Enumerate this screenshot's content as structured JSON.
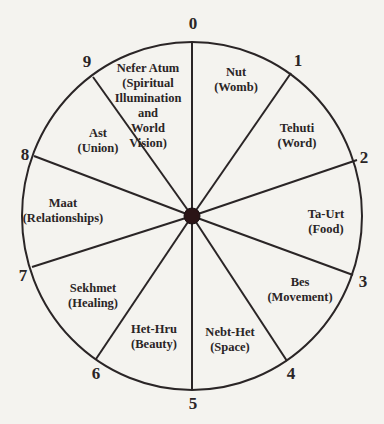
{
  "diagram": {
    "type": "wheel",
    "center": {
      "x": 192,
      "y": 216
    },
    "radius_x": 170,
    "radius_y": 174,
    "hub_radius": 8,
    "colors": {
      "background": "#f4f3ef",
      "ink": "#2a2526"
    },
    "spokes": [
      {
        "number": "0",
        "end": {
          "x": 192,
          "y": 42
        },
        "label_pos": {
          "x": 193,
          "y": 23
        }
      },
      {
        "number": "1",
        "end": {
          "x": 291,
          "y": 73
        },
        "label_pos": {
          "x": 298,
          "y": 60
        }
      },
      {
        "number": "2",
        "end": {
          "x": 357,
          "y": 160
        },
        "label_pos": {
          "x": 364,
          "y": 157
        }
      },
      {
        "number": "3",
        "end": {
          "x": 353,
          "y": 275
        },
        "label_pos": {
          "x": 363,
          "y": 281
        }
      },
      {
        "number": "4",
        "end": {
          "x": 287,
          "y": 361
        },
        "label_pos": {
          "x": 291,
          "y": 373
        }
      },
      {
        "number": "5",
        "end": {
          "x": 192,
          "y": 390
        },
        "label_pos": {
          "x": 193,
          "y": 403
        }
      },
      {
        "number": "6",
        "end": {
          "x": 96,
          "y": 359
        },
        "label_pos": {
          "x": 96,
          "y": 373
        }
      },
      {
        "number": "7",
        "end": {
          "x": 32,
          "y": 267
        },
        "label_pos": {
          "x": 23,
          "y": 275
        }
      },
      {
        "number": "8",
        "end": {
          "x": 34,
          "y": 156
        },
        "label_pos": {
          "x": 25,
          "y": 154
        }
      },
      {
        "number": "9",
        "end": {
          "x": 93,
          "y": 77
        },
        "label_pos": {
          "x": 87,
          "y": 61
        }
      }
    ],
    "sectors": [
      {
        "name": "Nut",
        "lines": [
          "Nut",
          "(Womb)"
        ],
        "pos": {
          "x": 236,
          "y": 80
        }
      },
      {
        "name": "Tehuti",
        "lines": [
          "Tehuti",
          "(Word)"
        ],
        "pos": {
          "x": 297,
          "y": 136
        }
      },
      {
        "name": "Ta-Urt",
        "lines": [
          "Ta-Urt",
          "(Food)"
        ],
        "pos": {
          "x": 326,
          "y": 222
        }
      },
      {
        "name": "Bes",
        "lines": [
          "Bes",
          "(Movement)"
        ],
        "pos": {
          "x": 300,
          "y": 290
        }
      },
      {
        "name": "Nebt-Het",
        "lines": [
          "Nebt-Het",
          "(Space)"
        ],
        "pos": {
          "x": 230,
          "y": 340
        }
      },
      {
        "name": "Het-Hru",
        "lines": [
          "Het-Hru",
          "(Beauty)"
        ],
        "pos": {
          "x": 154,
          "y": 337
        }
      },
      {
        "name": "Sekhmet",
        "lines": [
          "Sekhmet",
          "(Healing)"
        ],
        "pos": {
          "x": 93,
          "y": 296
        }
      },
      {
        "name": "Maat",
        "lines": [
          "Maat",
          "(Relationships)"
        ],
        "pos": {
          "x": 63,
          "y": 211
        }
      },
      {
        "name": "Ast",
        "lines": [
          "Ast",
          "(Union)"
        ],
        "pos": {
          "x": 98,
          "y": 141
        }
      },
      {
        "name": "Nefer Atum",
        "lines": [
          "Nefer Atum",
          "(Spiritual",
          "Illumination",
          "and",
          "World",
          "Vision)"
        ],
        "pos": {
          "x": 148,
          "y": 106
        }
      }
    ]
  }
}
